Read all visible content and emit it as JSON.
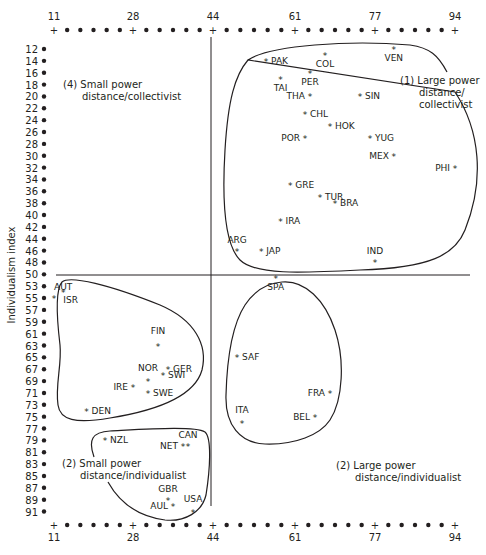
{
  "chart_data": {
    "type": "scatter",
    "title": "",
    "xlabel": "Power distance index",
    "ylabel": "Individualism index",
    "x_ticks": [
      11,
      28,
      44,
      61,
      77,
      94
    ],
    "y_ticks": [
      12,
      14,
      16,
      18,
      20,
      22,
      24,
      26,
      28,
      30,
      32,
      34,
      36,
      38,
      40,
      42,
      44,
      46,
      48,
      50,
      53,
      55,
      57,
      59,
      61,
      63,
      65,
      67,
      69,
      71,
      73,
      75,
      77,
      79,
      81,
      83,
      85,
      87,
      89,
      91
    ],
    "xlim": [
      11,
      94
    ],
    "ylim": [
      12,
      91
    ],
    "dividers": {
      "x": 44,
      "y": 50
    },
    "grid": false,
    "quadrants": [
      {
        "id": "q1",
        "label_line1": "(1)  Large power",
        "label_line2": "distance/",
        "label_line3": "collectivist"
      },
      {
        "id": "q4",
        "label_line1": "(4)  Small power",
        "label_line2": "distance/collectivist"
      },
      {
        "id": "q2-small",
        "label_line1": "(2)  Small power",
        "label_line2": "distance/individualist"
      },
      {
        "id": "q2-large",
        "label_line1": "(2)  Large power",
        "label_line2": "distance/individualist"
      }
    ],
    "points": [
      {
        "country": "PAK",
        "x": 55,
        "y": 14
      },
      {
        "country": "COL",
        "x": 67,
        "y": 13
      },
      {
        "country": "VEN",
        "x": 81,
        "y": 12
      },
      {
        "country": "TAI",
        "x": 58,
        "y": 17
      },
      {
        "country": "PER",
        "x": 64,
        "y": 16
      },
      {
        "country": "SIN",
        "x": 74,
        "y": 20
      },
      {
        "country": "THA",
        "x": 64,
        "y": 20
      },
      {
        "country": "CHL",
        "x": 63,
        "y": 23
      },
      {
        "country": "POR",
        "x": 63,
        "y": 27
      },
      {
        "country": "HOK",
        "x": 68,
        "y": 25
      },
      {
        "country": "YUG",
        "x": 76,
        "y": 27
      },
      {
        "country": "MEX",
        "x": 81,
        "y": 30
      },
      {
        "country": "PHI",
        "x": 94,
        "y": 32
      },
      {
        "country": "GRE",
        "x": 60,
        "y": 35
      },
      {
        "country": "TUR",
        "x": 66,
        "y": 37
      },
      {
        "country": "BRA",
        "x": 69,
        "y": 38
      },
      {
        "country": "IRA",
        "x": 58,
        "y": 41
      },
      {
        "country": "ARG",
        "x": 49,
        "y": 46
      },
      {
        "country": "JAP",
        "x": 54,
        "y": 46
      },
      {
        "country": "IND",
        "x": 77,
        "y": 48
      },
      {
        "country": "AUT",
        "x": 11,
        "y": 55
      },
      {
        "country": "ISR",
        "x": 13,
        "y": 54
      },
      {
        "country": "FIN",
        "x": 33,
        "y": 63
      },
      {
        "country": "NOR",
        "x": 31,
        "y": 69
      },
      {
        "country": "GER",
        "x": 35,
        "y": 67
      },
      {
        "country": "SWI",
        "x": 34,
        "y": 68
      },
      {
        "country": "IRE",
        "x": 28,
        "y": 70
      },
      {
        "country": "SWE",
        "x": 31,
        "y": 71
      },
      {
        "country": "DEN",
        "x": 18,
        "y": 74
      },
      {
        "country": "NZL",
        "x": 22,
        "y": 79
      },
      {
        "country": "NET",
        "x": 38,
        "y": 80
      },
      {
        "country": "CAN",
        "x": 39,
        "y": 80
      },
      {
        "country": "GBR",
        "x": 35,
        "y": 89
      },
      {
        "country": "AUL",
        "x": 36,
        "y": 90
      },
      {
        "country": "USA",
        "x": 40,
        "y": 91
      },
      {
        "country": "SPA",
        "x": 57,
        "y": 51
      },
      {
        "country": "SAF",
        "x": 49,
        "y": 65
      },
      {
        "country": "FRA",
        "x": 68,
        "y": 71
      },
      {
        "country": "BEL",
        "x": 65,
        "y": 75
      },
      {
        "country": "ITA",
        "x": 50,
        "y": 76
      }
    ]
  },
  "labels": {
    "ylabel": "Individualism index",
    "q1_l1": "(1)  Large power",
    "q1_l2": "distance/",
    "q1_l3": "collectivist",
    "q4_l1": "(4)  Small power",
    "q4_l2": "distance/collectivist",
    "q2s_l1": "(2)  Small power",
    "q2s_l2": "distance/individualist",
    "q2l_l1": "(2)  Large power",
    "q2l_l2": "distance/individualist"
  }
}
